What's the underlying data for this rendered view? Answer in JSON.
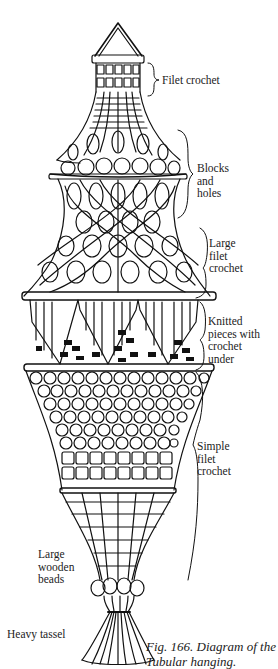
{
  "figure": {
    "caption": "Fig. 166. Diagram of the\nTubular hanging.",
    "stroke_color": "#111111",
    "background": "#ffffff"
  },
  "labels": [
    {
      "id": "filet-crochet",
      "text": "Filet crochet"
    },
    {
      "id": "blocks-and-holes",
      "text": "Blocks\nand\nholes"
    },
    {
      "id": "large-filet-crochet",
      "text": "Large\nfilet\ncrochet"
    },
    {
      "id": "knitted-pieces",
      "text": "Knitted\npieces with\ncrochet\nunder"
    },
    {
      "id": "simple-filet-crochet",
      "text": "Simple\nfilet\ncrochet"
    },
    {
      "id": "large-wooden-beads",
      "text": "Large\nwooden\nbeads"
    },
    {
      "id": "heavy-tassel",
      "text": "Heavy tassel"
    }
  ]
}
